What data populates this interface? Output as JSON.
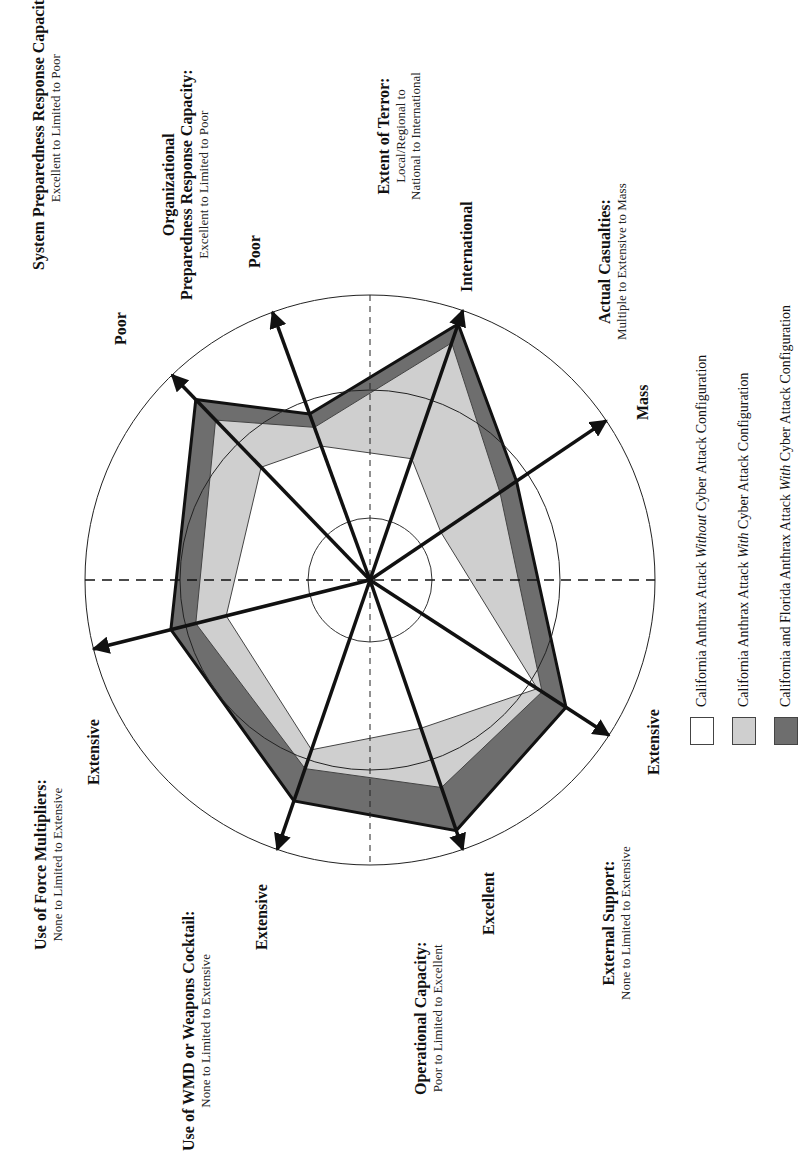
{
  "chart_data": {
    "type": "radar",
    "orientation": "rotated 90 degrees counter-clockwise",
    "title": "",
    "rings": [
      "inner",
      "middle",
      "outer"
    ],
    "axes": [
      {
        "key": "system_prep",
        "title": "System Preparedness Response Capacity:",
        "subtitle": "Excellent to Limited to Poor",
        "end_label": "Poor"
      },
      {
        "key": "org_prep",
        "title_line1": "Organizational",
        "title": "Preparedness Response Capacity:",
        "subtitle": "Excellent to Limited to Poor",
        "end_label": "Poor"
      },
      {
        "key": "terror",
        "title": "Extent of Terror:",
        "subtitle_line1": "Local/Regional to",
        "subtitle": "National to International",
        "end_label": "International"
      },
      {
        "key": "casualties",
        "title": "Actual Casualties:",
        "subtitle": "Multiple to Extensive to Mass",
        "end_label": "Mass"
      },
      {
        "key": "external_support",
        "title": "External Support:",
        "subtitle": "None to Limited to Extensive",
        "end_label": "Extensive"
      },
      {
        "key": "operational",
        "title": "Operational Capacity:",
        "subtitle": "Poor to Limited to Excellent",
        "end_label": "Excellent"
      },
      {
        "key": "wmd",
        "title": "Use of WMD or Weapons Cocktail:",
        "subtitle": "None to Limited to Extensive",
        "end_label": "Extensive"
      },
      {
        "key": "force_mult",
        "title": "Use of Force Multipliers:",
        "subtitle": "None to Limited to Extensive",
        "end_label": "Extensive"
      }
    ],
    "series": [
      {
        "name": "California and Florida Anthrax Attack With Cyber Attack Configuration",
        "color": "#6e6e6e",
        "values": [
          0.88,
          0.62,
          0.95,
          0.62,
          0.82,
          0.93,
          0.82,
          0.72
        ]
      },
      {
        "name": "California Anthrax Attack With Cyber Attack Configuration",
        "color": "#cfcfcf",
        "values": [
          0.78,
          0.57,
          0.88,
          0.55,
          0.72,
          0.77,
          0.7,
          0.63
        ]
      },
      {
        "name": "California Anthrax Attack Without Cyber Attack Configuration",
        "color": "#ffffff",
        "values": [
          0.55,
          0.5,
          0.45,
          0.3,
          0.7,
          0.55,
          0.63,
          0.52
        ]
      }
    ],
    "value_scale": "fraction of outer ring (0 = center, 1 = outer circle)"
  },
  "legend": [
    {
      "pre": "California Anthrax Attack ",
      "em": "Without",
      "post": " Cyber Attack Configuration",
      "color": "#ffffff"
    },
    {
      "pre": "California Anthrax Attack ",
      "em": "With",
      "post": " Cyber Attack Configuration",
      "color": "#cfcfcf"
    },
    {
      "pre": "California and Florida Anthrax Attack ",
      "em": "With",
      "post": " Cyber Attack Configuration",
      "color": "#6e6e6e"
    }
  ]
}
